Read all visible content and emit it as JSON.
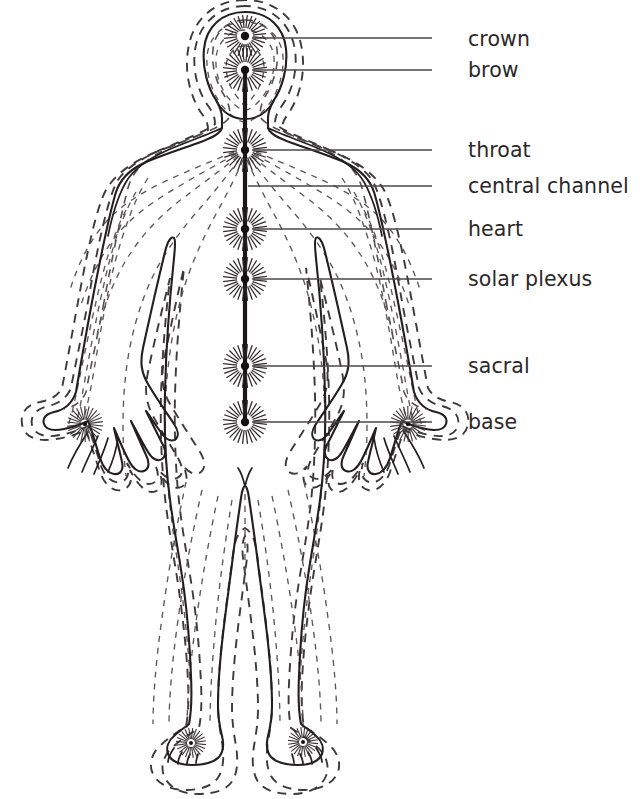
{
  "diagram": {
    "background_color": "#ffffff",
    "ink_color": "#231f20",
    "aura_color": "#55504f",
    "label_color": "#2b2829",
    "leader_color": "#4a4748"
  },
  "labels": [
    {
      "id": "crown",
      "text": "crown",
      "x": 468,
      "y": 29,
      "leader_from_x": 432,
      "leader_to_x": 252,
      "leader_y": 38,
      "curve": true
    },
    {
      "id": "brow",
      "text": "brow",
      "x": 468,
      "y": 60,
      "leader_from_x": 432,
      "leader_to_x": 252,
      "leader_y": 70,
      "curve": true
    },
    {
      "id": "throat",
      "text": "throat",
      "x": 468,
      "y": 140,
      "leader_from_x": 432,
      "leader_to_x": 252,
      "leader_y": 150,
      "curve": false
    },
    {
      "id": "central-channel",
      "text": "central channel",
      "x": 468,
      "y": 176,
      "leader_from_x": 432,
      "leader_to_x": 248,
      "leader_y": 186,
      "curve": false
    },
    {
      "id": "heart",
      "text": "heart",
      "x": 468,
      "y": 219,
      "leader_from_x": 432,
      "leader_to_x": 252,
      "leader_y": 229,
      "curve": false
    },
    {
      "id": "solar-plexus",
      "text": "solar plexus",
      "x": 468,
      "y": 269,
      "leader_from_x": 432,
      "leader_to_x": 252,
      "leader_y": 279,
      "curve": false
    },
    {
      "id": "sacral",
      "text": "sacral",
      "x": 468,
      "y": 356,
      "leader_from_x": 432,
      "leader_to_x": 252,
      "leader_y": 366,
      "curve": false
    },
    {
      "id": "base",
      "text": "base",
      "x": 468,
      "y": 412,
      "leader_from_x": 432,
      "leader_to_x": 252,
      "leader_y": 422,
      "curve": false
    }
  ],
  "chakra_points": [
    {
      "id": "crown",
      "label": "crown",
      "cx": 245,
      "cy": 36,
      "radius": 4.2,
      "ray_count": 28,
      "ray_inner": 8,
      "ray_outer": 21,
      "labeled": true
    },
    {
      "id": "brow",
      "label": "brow",
      "cx": 245,
      "cy": 70,
      "radius": 4.2,
      "ray_count": 28,
      "ray_inner": 8,
      "ray_outer": 22,
      "labeled": true
    },
    {
      "id": "throat",
      "label": "throat",
      "cx": 245,
      "cy": 150,
      "radius": 4.2,
      "ray_count": 28,
      "ray_inner": 8,
      "ray_outer": 22,
      "labeled": true
    },
    {
      "id": "heart",
      "label": "heart",
      "cx": 245,
      "cy": 229,
      "radius": 4.2,
      "ray_count": 28,
      "ray_inner": 8,
      "ray_outer": 22,
      "labeled": true
    },
    {
      "id": "solar-plexus",
      "label": "solar plexus",
      "cx": 245,
      "cy": 279,
      "radius": 4.2,
      "ray_count": 28,
      "ray_inner": 8,
      "ray_outer": 22,
      "labeled": true
    },
    {
      "id": "sacral",
      "label": "sacral",
      "cx": 245,
      "cy": 366,
      "radius": 4.2,
      "ray_count": 28,
      "ray_inner": 8,
      "ray_outer": 22,
      "labeled": true
    },
    {
      "id": "base",
      "label": "base",
      "cx": 245,
      "cy": 422,
      "radius": 4.2,
      "ray_count": 28,
      "ray_inner": 8,
      "ray_outer": 22,
      "labeled": true
    },
    {
      "id": "palm-left",
      "label": "left palm",
      "cx": 85,
      "cy": 424,
      "radius": 2.2,
      "ray_count": 26,
      "ray_inner": 4.5,
      "ray_outer": 18,
      "labeled": false
    },
    {
      "id": "palm-right",
      "label": "right palm",
      "cx": 408,
      "cy": 424,
      "radius": 2.2,
      "ray_count": 26,
      "ray_inner": 4.5,
      "ray_outer": 18,
      "labeled": false
    },
    {
      "id": "sole-left",
      "label": "left sole",
      "cx": 191,
      "cy": 743,
      "radius": 2.0,
      "ray_count": 24,
      "ray_inner": 4,
      "ray_outer": 15,
      "labeled": false
    },
    {
      "id": "sole-right",
      "label": "right sole",
      "cx": 303,
      "cy": 742,
      "radius": 2.0,
      "ray_count": 24,
      "ray_inner": 4,
      "ray_outer": 15,
      "labeled": false
    }
  ],
  "central_channel": {
    "x": 245,
    "top_y": 74,
    "bottom_y": 424,
    "stroke_width": 4.2
  },
  "body_paths": {
    "outline": "M245,12 C222,12 206,27 204,49 C202,68 208,88 216,100 C220,107 222,112 222,118 L222,128 C220,134 212,138 198,143 C178,150 156,157 142,164 C128,171 120,180 116,192 C110,212 100,260 92,302 C86,334 80,368 76,392 C72,404 64,410 54,412 C46,414 42,418 44,424 C46,430 54,431 64,429 C74,427 82,424 88,421 C92,430 96,446 100,458 C103,467 108,473 114,474 C120,475 124,470 122,462 C120,452 116,438 114,428 C118,437 124,452 129,461 C133,469 139,473 144,471 C149,469 150,463 146,455 C141,444 135,430 131,421 C136,430 143,444 148,452 C152,459 158,462 162,459 C166,456 166,450 162,443 C157,433 150,419 146,411 C152,419 158,429 163,435 C167,440 172,442 176,439 C179,436 178,430 174,424 C166,412 155,396 148,384 C141,372 140,362 143,348 C150,316 160,272 166,248 C168,240 172,236 174,238 C176,240 175,248 174,258 C170,296 166,348 165,392 C164,430 166,470 170,500 C174,530 180,560 184,590 C188,620 190,650 191,676 C192,698 191,714 189,724 C184,728 178,732 174,736 C168,741 166,748 168,754 C171,761 180,765 192,765 C204,765 214,762 219,757 C223,752 224,744 222,736 C220,728 218,718 218,706 C218,686 220,660 223,634 C226,608 230,580 233,556 C236,532 239,512 241,498 C242,490 244,486 245,486 C246,486 248,490 249,498 C251,512 254,532 257,556 C260,580 264,608 267,634 C270,660 272,686 272,706 C272,718 270,728 268,736 C266,744 267,752 271,757 C276,762 286,765 298,765 C310,765 319,761 322,754 C324,748 322,741 316,736 C312,732 306,728 301,724 C299,714 298,698 299,676 C300,650 302,620 306,590 C310,560 316,530 320,500 C324,470 326,430 325,392 C324,348 320,296 316,258 C315,248 314,240 316,238 C318,236 322,240 324,248 C330,272 340,316 347,348 C350,362 349,372 342,384 C335,396 324,412 316,424 C312,430 311,436 314,439 C318,442 323,440 327,435 C332,429 338,419 344,411 C340,419 333,433 328,443 C324,450 324,456 328,459 C332,462 338,459 342,452 C347,444 354,430 359,421 C355,430 349,444 344,455 C340,463 341,469 346,471 C351,473 357,469 361,461 C366,452 372,437 376,428 C374,438 370,452 368,462 C366,470 370,475 376,474 C382,473 387,467 390,458 C394,446 398,430 402,421 C408,424 416,427 426,429 C436,431 444,430 446,424 C448,418 444,414 436,412 C426,410 418,404 414,392 C410,368 404,334 398,302 C390,260 380,212 374,192 C370,180 362,171 348,164 C334,157 312,150 292,143 C278,138 270,134 268,128 L268,118 C268,112 270,107 274,100 C282,88 288,68 286,49 C284,27 268,12 245,12 Z",
    "jaw": "M216,100 C222,112 232,119 245,119 C258,119 268,112 274,100",
    "shoulder_left": "M222,128 C210,134 186,142 168,150 C150,158 134,168 126,182 C118,196 112,216 108,236",
    "shoulder_right": "M268,128 C280,134 304,142 322,150 C340,158 356,168 364,182 C372,196 378,216 382,236",
    "armpit_left": "M146,308 C142,328 138,352 136,374",
    "armpit_right": "M344,308 C348,328 352,352 354,374",
    "torso_left": "M166,248 C160,282 156,320 155,352",
    "torso_right": "M324,248 C330,282 334,320 335,352",
    "crotch": "M245,486 C243,478 241,472 238,468 M245,486 C247,478 249,472 252,468",
    "knee_left": "M172,560 C178,566 192,568 202,564",
    "knee_right": "M318,560 C312,566 298,568 288,564",
    "ankle_left": "M178,712 C184,716 194,717 200,714",
    "ankle_right": "M312,712 C306,716 296,717 290,714",
    "hand_left_fingers": "M88,432 C80,444 72,458 68,468 M98,436 C92,450 86,462 82,472 M108,438 C104,452 98,464 94,474 M118,438 C116,452 112,463 108,472",
    "hand_right_fingers": "M404,432 C412,444 420,458 424,468 M394,436 C400,450 406,462 410,472 M384,438 C388,452 394,464 398,474 M374,438 C376,452 380,463 384,472",
    "foot_left_toes": "M174,748 C170,754 168,758 168,762 M182,752 C179,757 178,760 178,764 M190,754 C188,758 187,761 187,764 M198,754 C197,758 196,760 196,763",
    "foot_right_toes": "M316,748 C320,754 322,758 322,762 M308,752 C311,757 312,760 312,764 M300,754 C302,758 303,761 303,764 M292,754 C293,758 294,760 294,763"
  }
}
